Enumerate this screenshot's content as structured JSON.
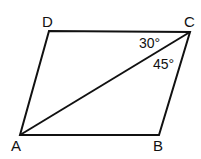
{
  "diagram": {
    "type": "parallelogram",
    "vertices": {
      "A": {
        "label": "A",
        "x": 20,
        "y": 135
      },
      "B": {
        "label": "B",
        "x": 159,
        "y": 135
      },
      "C": {
        "label": "C",
        "x": 190,
        "y": 32
      },
      "D": {
        "label": "D",
        "x": 49,
        "y": 31
      }
    },
    "segments": [
      "AB",
      "BC",
      "CD",
      "DA",
      "AC"
    ],
    "angles": [
      {
        "label": "30°",
        "at": "C",
        "between": [
          "DC",
          "AC"
        ]
      },
      {
        "label": "45°",
        "at": "C",
        "between": [
          "AC",
          "BC"
        ]
      }
    ],
    "stroke_color": "#111111"
  }
}
